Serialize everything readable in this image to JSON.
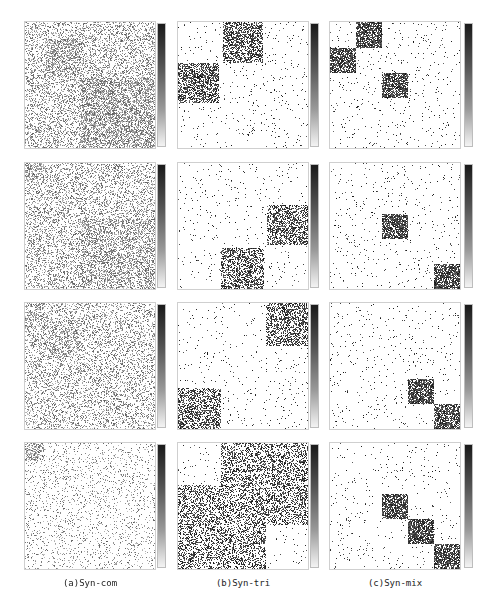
{
  "figure": {
    "columns": [
      {
        "id": "a",
        "caption": "(a)Syn-com"
      },
      {
        "id": "b",
        "caption": "(b)Syn-tri"
      },
      {
        "id": "c",
        "caption": "(c)Syn-mix"
      }
    ],
    "rows": 4
  },
  "chart_data": {
    "type": "heatmap",
    "title": "",
    "colorbar": {
      "from": "#1a1a1a",
      "to": "#f4f4f4",
      "orientation": "vertical"
    },
    "panels": [
      {
        "column": "a",
        "row": 1,
        "background_density": 0.32,
        "blocks": [
          [
            0.15,
            0.13,
            0.43,
            0.44,
            0.55
          ],
          [
            0.43,
            0.44,
            1.0,
            1.0,
            0.55
          ]
        ]
      },
      {
        "column": "a",
        "row": 2,
        "background_density": 0.3,
        "blocks": [
          [
            0.0,
            0.0,
            0.13,
            0.13,
            0.5
          ],
          [
            0.43,
            0.44,
            1.0,
            1.0,
            0.45
          ]
        ]
      },
      {
        "column": "a",
        "row": 3,
        "background_density": 0.28,
        "blocks": [
          [
            0.0,
            0.0,
            0.14,
            0.14,
            0.45
          ],
          [
            0.12,
            0.14,
            0.43,
            0.43,
            0.42
          ]
        ]
      },
      {
        "column": "a",
        "row": 4,
        "background_density": 0.12,
        "blocks": [
          [
            0.0,
            0.0,
            0.14,
            0.14,
            0.5
          ]
        ]
      },
      {
        "column": "b",
        "row": 1,
        "background_density": 0.025,
        "blocks": [
          [
            0.34,
            0.0,
            0.65,
            0.32,
            0.55
          ],
          [
            0.0,
            0.32,
            0.31,
            0.64,
            0.55
          ]
        ]
      },
      {
        "column": "b",
        "row": 2,
        "background_density": 0.025,
        "blocks": [
          [
            0.68,
            0.33,
            1.0,
            0.65,
            0.5
          ],
          [
            0.33,
            0.67,
            0.66,
            1.0,
            0.5
          ]
        ]
      },
      {
        "column": "b",
        "row": 3,
        "background_density": 0.025,
        "blocks": [
          [
            0.67,
            0.0,
            1.0,
            0.34,
            0.5
          ],
          [
            0.0,
            0.67,
            0.33,
            1.0,
            0.5
          ]
        ]
      },
      {
        "column": "b",
        "row": 4,
        "background_density": 0.02,
        "blocks": [
          [
            0.33,
            0.0,
            1.0,
            0.65,
            0.4
          ],
          [
            0.0,
            0.33,
            0.67,
            1.0,
            0.4
          ]
        ]
      },
      {
        "column": "c",
        "row": 1,
        "background_density": 0.025,
        "blocks": [
          [
            0.2,
            0.0,
            0.4,
            0.2,
            0.75
          ],
          [
            0.0,
            0.2,
            0.2,
            0.4,
            0.75
          ],
          [
            0.4,
            0.4,
            0.6,
            0.6,
            0.75
          ]
        ]
      },
      {
        "column": "c",
        "row": 2,
        "background_density": 0.025,
        "blocks": [
          [
            0.4,
            0.4,
            0.6,
            0.6,
            0.75
          ],
          [
            0.8,
            0.8,
            1.0,
            1.0,
            0.75
          ]
        ]
      },
      {
        "column": "c",
        "row": 3,
        "background_density": 0.025,
        "blocks": [
          [
            0.6,
            0.6,
            0.8,
            0.8,
            0.75
          ],
          [
            0.8,
            0.8,
            1.0,
            1.0,
            0.75
          ]
        ]
      },
      {
        "column": "c",
        "row": 4,
        "background_density": 0.025,
        "blocks": [
          [
            0.4,
            0.4,
            0.6,
            0.6,
            0.75
          ],
          [
            0.6,
            0.6,
            0.8,
            0.8,
            0.75
          ],
          [
            0.8,
            0.8,
            1.0,
            1.0,
            0.75
          ]
        ]
      }
    ],
    "xlabel": "",
    "ylabel": "",
    "legend": "none"
  }
}
